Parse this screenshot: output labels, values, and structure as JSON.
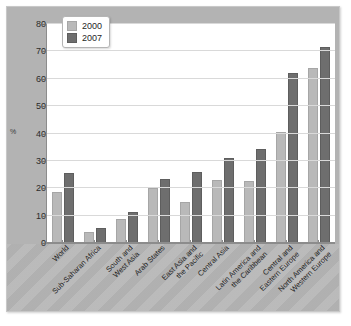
{
  "chart_data": {
    "type": "bar",
    "title": "",
    "subtitle": "",
    "xlabel": "",
    "ylabel": "%",
    "ylim": [
      0,
      80
    ],
    "yticks": [
      0,
      10,
      20,
      30,
      40,
      50,
      60,
      70,
      80
    ],
    "grid": true,
    "legend_position": "top-left",
    "categories": [
      "World",
      "Sub-Saharan Africa",
      "South and West Asia",
      "Arab States",
      "East Asia and the Pacific",
      "Central Asia",
      "Latin America and the Caribbean",
      "Central and Eastern Europe",
      "North America and Western Europe"
    ],
    "category_lines": [
      [
        "World"
      ],
      [
        "Sub-Saharan Africa"
      ],
      [
        "South and",
        "West Asia"
      ],
      [
        "Arab States"
      ],
      [
        "East Asia and",
        "the Pacific"
      ],
      [
        "Central Asia"
      ],
      [
        "Latin America and",
        "the Caribbean"
      ],
      [
        "Central and",
        "Eastern Europe"
      ],
      [
        "North America and",
        "Western Europe"
      ]
    ],
    "series": [
      {
        "name": "2000",
        "color": "#b9b9b9",
        "values": [
          18.5,
          4,
          8.8,
          20,
          15,
          23,
          22.8,
          40.5,
          64
        ]
      },
      {
        "name": "2007",
        "color": "#6e6e6e",
        "values": [
          25.5,
          5.5,
          11.5,
          23.5,
          26,
          31,
          34.2,
          62,
          71.5
        ]
      }
    ]
  },
  "legend": {
    "entries": [
      {
        "label": "2000"
      },
      {
        "label": "2007"
      }
    ]
  },
  "colors": {
    "series_2000": "#b9b9b9",
    "series_2007": "#6e6e6e",
    "plot_background": "#ffffff",
    "figure_background": "#b3b3b3",
    "gridline": "#d9d9d9",
    "axis": "#8c8c8c"
  }
}
